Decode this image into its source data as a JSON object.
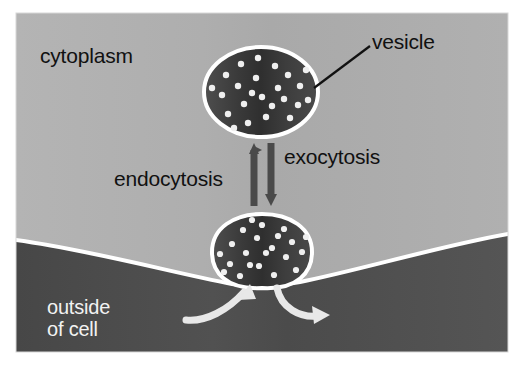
{
  "figure": {
    "canvas": {
      "width": 524,
      "height": 383
    },
    "page_background": "#ffffff",
    "border": {
      "left": 16,
      "top": 13,
      "right": 508,
      "bottom": 352
    }
  },
  "regions": {
    "cytoplasm": {
      "label": "cytoplasm",
      "fill": "#adadad",
      "text_color": "#111111"
    },
    "outside_of_cell": {
      "label": "outside\nof cell",
      "line1": "outside",
      "line2": "of cell",
      "fill": "#4d4d4d",
      "text_color": "#f2f2f2"
    },
    "membrane": {
      "name": "plasma-membrane",
      "color": "#ffffff",
      "thickness": 4
    }
  },
  "vesicles": [
    {
      "name": "free-vesicle",
      "label": "vesicle",
      "fill": "#3a3a3a",
      "outline": "#ffffff",
      "cx": 261,
      "cy": 92,
      "rx": 57,
      "ry": 45,
      "cargo_dots": 24,
      "dot_color": "#f0f0f0"
    },
    {
      "name": "fusing-vesicle",
      "fill": "#3a3a3a",
      "outline": "#ffffff",
      "cx": 262,
      "cy": 254,
      "rx": 50,
      "ry": 33,
      "cargo_dots": 22,
      "dot_color": "#f0f0f0"
    }
  ],
  "arrows": {
    "endocytosis": {
      "label": "endocytosis",
      "direction": "up",
      "color": "#4a4a4a",
      "x": 254,
      "y_top": 143,
      "y_bottom": 206
    },
    "exocytosis": {
      "label": "exocytosis",
      "direction": "down",
      "color": "#4a4a4a",
      "x": 271,
      "y_top": 143,
      "y_bottom": 206
    },
    "uptake_curve": {
      "name": "uptake-arrow",
      "color": "#e8e8e8",
      "direction": "into-cell"
    },
    "release_curve": {
      "name": "release-arrow",
      "color": "#e8e8e8",
      "direction": "out-of-cell"
    }
  },
  "leader_lines": [
    {
      "name": "vesicle-leader-line",
      "color": "#111111",
      "from": [
        314,
        88
      ],
      "to": [
        370,
        46
      ]
    }
  ]
}
